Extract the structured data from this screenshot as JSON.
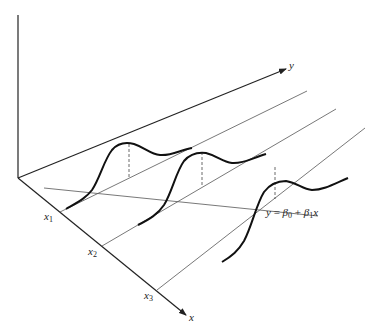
{
  "diagram": {
    "type": "3d-regression-illustration",
    "axes": {
      "vertical": {
        "label": ""
      },
      "y_axis": {
        "label": "y"
      },
      "x_axis": {
        "label": "x"
      }
    },
    "x_ticks": [
      {
        "name": "x1",
        "base": "x",
        "sub": "1"
      },
      {
        "name": "x2",
        "base": "x",
        "sub": "2"
      },
      {
        "name": "x3",
        "base": "x",
        "sub": "3"
      }
    ],
    "regression_label": {
      "lhs": "y",
      "eq": " = ",
      "beta0": "β",
      "beta0_sub": "0",
      "plus": " + ",
      "beta1": "β",
      "beta1_sub": "1",
      "var": "x"
    },
    "colors": {
      "ink": "#222222",
      "thin_line": "#555555",
      "background": "#ffffff"
    }
  }
}
